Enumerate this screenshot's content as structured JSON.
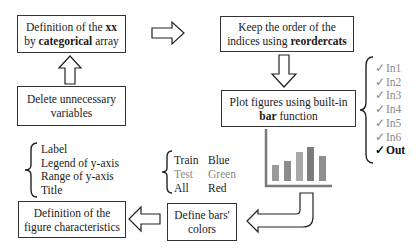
{
  "boxes": {
    "definition_xx": {
      "pre": "Definition of the ",
      "bold1": "xx",
      "line2_pre": "by ",
      "bold2": "categorical",
      "line2_post": " array"
    },
    "delete_vars": {
      "line1": "Delete unnecessary",
      "line2": "variables"
    },
    "reordercats": {
      "line1": "Keep the order of the",
      "line2_pre": "indices using ",
      "bold": "reordercats"
    },
    "plot_bar": {
      "line1": "Plot figures using built-in",
      "bold": "bar",
      "line2_post": " function"
    },
    "define_colors": {
      "line1": "Define bars'",
      "line2": "colors"
    },
    "figure_chars": {
      "line1": "Definition of the",
      "line2": "figure characteristics"
    }
  },
  "figure_characteristics_list": [
    "Label",
    "Legend of y-axis",
    "Range of y-axis",
    "Title"
  ],
  "bar_colors": [
    {
      "set": "Train",
      "color": "Blue",
      "muted": false
    },
    {
      "set": "Test",
      "color": "Green",
      "muted": true
    },
    {
      "set": "All",
      "color": "Red",
      "muted": false
    }
  ],
  "plotted_variables": [
    {
      "check": "✓",
      "label": "In1",
      "muted": true
    },
    {
      "check": "✓",
      "label": "In2",
      "muted": true
    },
    {
      "check": "✓",
      "label": "In3",
      "muted": true
    },
    {
      "check": "✓",
      "label": "In4",
      "muted": true
    },
    {
      "check": "✓",
      "label": "In5",
      "muted": true
    },
    {
      "check": "✓",
      "label": "In6",
      "muted": true
    },
    {
      "check": "✓",
      "label": "Out",
      "muted": false
    }
  ],
  "bar_icon": {
    "relative_heights": [
      16,
      20,
      29,
      34,
      25
    ],
    "bar_colors": [
      "#9a9a9a",
      "#8c8c8c",
      "#a8a8a8",
      "#7c7c7c",
      "#8e8e8e"
    ],
    "axis_color": "#7a7a7a"
  },
  "colors": {
    "border": "#333333",
    "arrow": "#222222",
    "muted_text": "#8a8a8a"
  }
}
